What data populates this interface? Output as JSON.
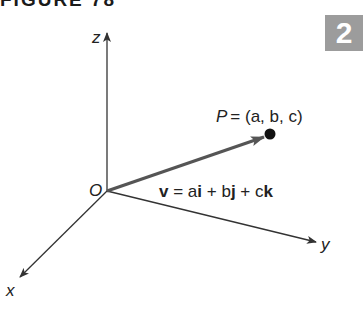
{
  "figure": {
    "title": "FIGURE 78",
    "section_badge": "2"
  },
  "diagram": {
    "axes": {
      "z_label": "z",
      "y_label": "y",
      "x_label": "x",
      "origin_label": "O"
    },
    "point": {
      "name": "P",
      "coords": "= (a, b, c)"
    },
    "vector": {
      "name": "v",
      "eq": " = a",
      "i": "i",
      "plus_b": " + b",
      "j": "j",
      "plus_c": " + c",
      "k": "k"
    },
    "colors": {
      "axis": "#333333",
      "vector": "#555555",
      "point": "#111111",
      "badge": "#9c9c9c"
    }
  }
}
